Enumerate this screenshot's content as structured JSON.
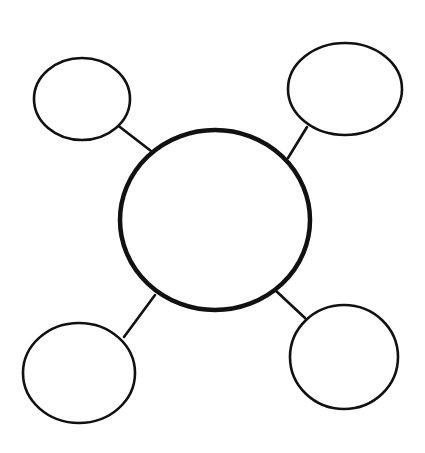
{
  "diagram": {
    "type": "bubble-map",
    "background": "#ffffff",
    "stroke_color": "#111111",
    "center_node": {
      "id": "center",
      "label": "",
      "cx": 215,
      "cy": 220,
      "rx": 95,
      "ry": 90,
      "stroke_width": 4.5
    },
    "satellite_nodes": [
      {
        "id": "top-left",
        "label": "",
        "cx": 82,
        "cy": 99,
        "rx": 48,
        "ry": 41,
        "stroke_width": 2.6
      },
      {
        "id": "top-right",
        "label": "",
        "cx": 345,
        "cy": 89,
        "rx": 57,
        "ry": 46,
        "stroke_width": 2.6
      },
      {
        "id": "bottom-left",
        "label": "",
        "cx": 79,
        "cy": 373,
        "rx": 56,
        "ry": 50,
        "stroke_width": 2.6
      },
      {
        "id": "bottom-right",
        "label": "",
        "cx": 344,
        "cy": 357,
        "rx": 54,
        "ry": 52,
        "stroke_width": 2.6
      }
    ],
    "connectors": [
      {
        "from": "top-left",
        "to": "center",
        "x1": 116,
        "y1": 124,
        "x2": 151,
        "y2": 151
      },
      {
        "from": "top-right",
        "to": "center",
        "x1": 307,
        "y1": 127,
        "x2": 288,
        "y2": 158
      },
      {
        "from": "bottom-left",
        "to": "center",
        "x1": 124,
        "y1": 337,
        "x2": 155,
        "y2": 295
      },
      {
        "from": "bottom-right",
        "to": "center",
        "x1": 275,
        "y1": 290,
        "x2": 305,
        "y2": 318
      }
    ]
  }
}
